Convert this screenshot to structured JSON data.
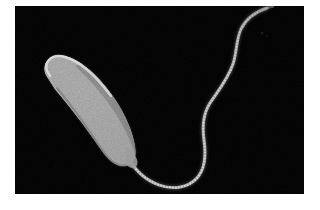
{
  "figure": {
    "name": "electron-micrograph",
    "organism_label": "",
    "caption": "",
    "scale_bar_label": "",
    "modality": "transmission-electron-micrograph",
    "background_color": "#000000",
    "page_color": "#ffffff",
    "plate": {
      "left": 15,
      "top": 6,
      "width": 289,
      "height": 188
    }
  },
  "specimen": {
    "cell_body": {
      "name": "bacterial-cell-body",
      "shape": "curved-rod",
      "fill_color": "#b5b5b5",
      "core_color": "#c8c8c8",
      "rim_color": "#d8d8d8",
      "shadow_color": "#6a6a6a",
      "texture": "granular-speckled-cytoplasm",
      "tip_left": [
        26,
        62
      ],
      "tip_right": [
        128,
        155
      ],
      "length_px": 118,
      "width_px": 44
    },
    "flagellum": {
      "name": "polar-flagellum",
      "count": 1,
      "attachment": "polar",
      "stroke_color": "#b8b8b8",
      "core_color": "#d6d6d6",
      "thickness_px": 2.6,
      "waveform": "sinusoidal",
      "path_points": [
        [
          128,
          158
        ],
        [
          140,
          170
        ],
        [
          152,
          181
        ],
        [
          168,
          187
        ],
        [
          184,
          187
        ],
        [
          196,
          180
        ],
        [
          203,
          168
        ],
        [
          205,
          152
        ],
        [
          203,
          136
        ],
        [
          203,
          120
        ],
        [
          209,
          104
        ],
        [
          220,
          90
        ],
        [
          229,
          74
        ],
        [
          234,
          56
        ],
        [
          236,
          38
        ],
        [
          241,
          22
        ],
        [
          252,
          11
        ],
        [
          266,
          7
        ]
      ]
    }
  },
  "noise": {
    "speckle_seed": 7,
    "speckle_count": 420,
    "speckle_color_light": "#d0d0d0",
    "speckle_color_dark": "#8a8a8a"
  }
}
